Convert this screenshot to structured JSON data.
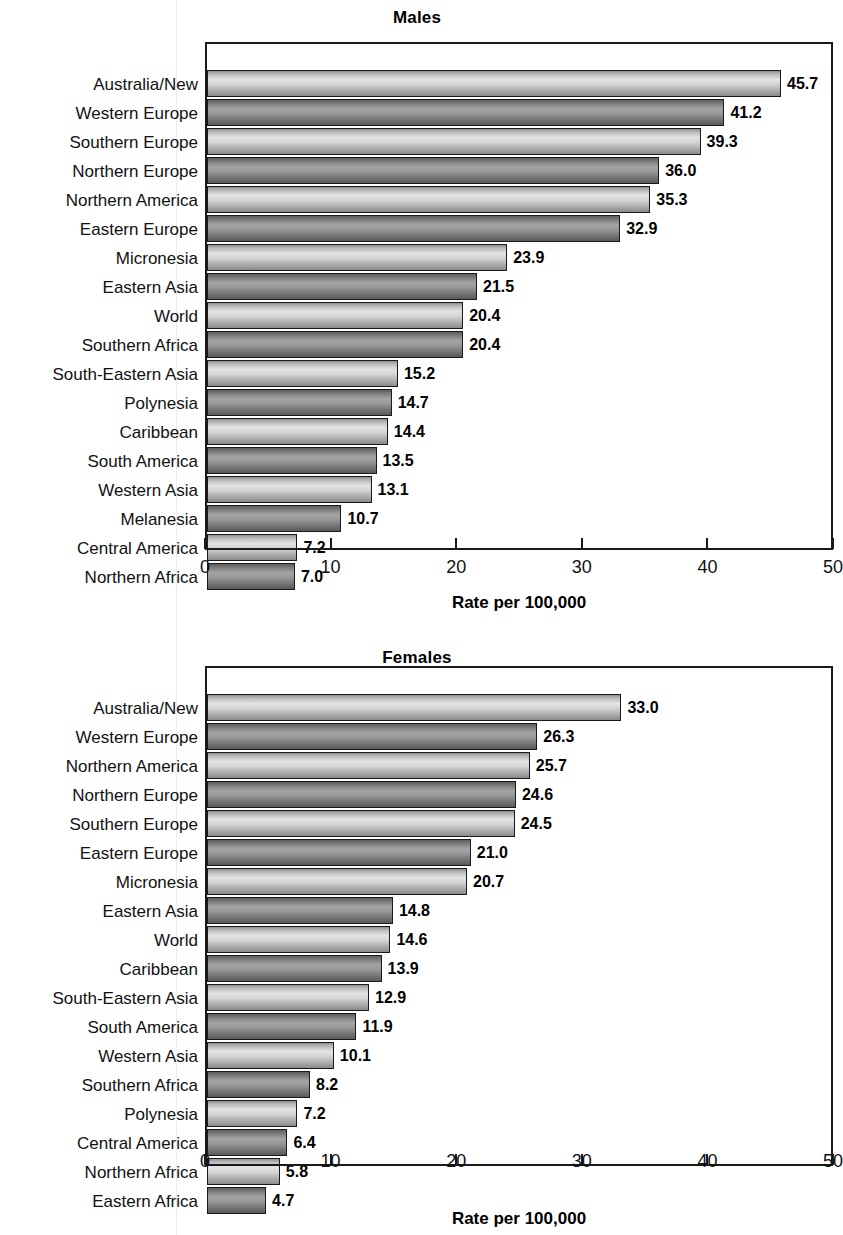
{
  "figure": {
    "axis_title": "Rate per 100,000",
    "tick_labels": [
      "0",
      "10",
      "20",
      "30",
      "40",
      "50"
    ],
    "colors": {
      "bar_light": "#d2d2d2",
      "bar_dark": "#969696",
      "outline": "#1a1a1a",
      "text": "#111111",
      "background": "#ffffff"
    }
  },
  "chart_data": [
    {
      "type": "bar",
      "orientation": "horizontal",
      "title": "Males",
      "xlabel": "Rate per 100,000",
      "ylabel": "",
      "xlim": [
        0,
        50
      ],
      "xticks": [
        0,
        10,
        20,
        30,
        40,
        50
      ],
      "grid": false,
      "legend": false,
      "categories": [
        "Australia/New",
        "Western Europe",
        "Southern Europe",
        "Northern Europe",
        "Northern America",
        "Eastern Europe",
        "Micronesia",
        "Eastern Asia",
        "World",
        "Southern Africa",
        "South-Eastern Asia",
        "Polynesia",
        "Caribbean",
        "South America",
        "Western Asia",
        "Melanesia",
        "Central America",
        "Northern Africa"
      ],
      "values": [
        45.7,
        41.2,
        39.3,
        36.0,
        35.3,
        32.9,
        23.9,
        21.5,
        20.4,
        20.4,
        15.2,
        14.7,
        14.4,
        13.5,
        13.1,
        10.7,
        7.2,
        7.0
      ],
      "value_labels": [
        "45.7",
        "41.2",
        "39.3",
        "36.0",
        "35.3",
        "32.9",
        "23.9",
        "21.5",
        "20.4",
        "20.4",
        "15.2",
        "14.7",
        "14.4",
        "13.5",
        "13.1",
        "10.7",
        "7.2",
        "7.0"
      ]
    },
    {
      "type": "bar",
      "orientation": "horizontal",
      "title": "Females",
      "xlabel": "Rate per 100,000",
      "ylabel": "",
      "xlim": [
        0,
        50
      ],
      "xticks": [
        0,
        10,
        20,
        30,
        40,
        50
      ],
      "grid": false,
      "legend": false,
      "categories": [
        "Australia/New",
        "Western Europe",
        "Northern America",
        "Northern Europe",
        "Southern Europe",
        "Eastern Europe",
        "Micronesia",
        "Eastern Asia",
        "World",
        "Caribbean",
        "South-Eastern Asia",
        "South America",
        "Western Asia",
        "Southern Africa",
        "Polynesia",
        "Central America",
        "Northern Africa",
        "Eastern Africa"
      ],
      "values": [
        33.0,
        26.3,
        25.7,
        24.6,
        24.5,
        21.0,
        20.7,
        14.8,
        14.6,
        13.9,
        12.9,
        11.9,
        10.1,
        8.2,
        7.2,
        6.4,
        5.8,
        4.7
      ],
      "value_labels": [
        "33.0",
        "26.3",
        "25.7",
        "24.6",
        "24.5",
        "21.0",
        "20.7",
        "14.8",
        "14.6",
        "13.9",
        "12.9",
        "11.9",
        "10.1",
        "8.2",
        "7.2",
        "6.4",
        "5.8",
        "4.7"
      ]
    }
  ]
}
